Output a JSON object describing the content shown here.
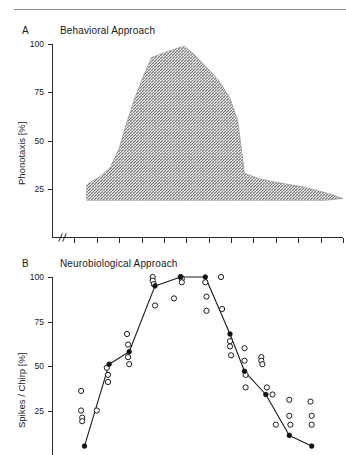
{
  "figure": {
    "background": "#ffffff",
    "ink": "#1a1a1a",
    "rule_color": "#8d8d8d"
  },
  "panels": {
    "a": {
      "letter": "A",
      "title": "Behavioral  Approach",
      "ylabel": "Phonotaxis  [%]",
      "yticks": [
        "100",
        "75",
        "50",
        "25"
      ]
    },
    "b": {
      "letter": "B",
      "title": "Neurobiological  Approach",
      "ylabel": "Spikes / Chirp  [%]",
      "yticks": [
        "100",
        "75",
        "50",
        "25"
      ]
    }
  },
  "chart_data": [
    {
      "type": "area",
      "panel": "A",
      "title": "Behavioral  Approach",
      "xlabel": "",
      "ylabel": "Phonotaxis [%]",
      "ylim": [
        0,
        100
      ],
      "yticks": [
        25,
        50,
        75,
        100
      ],
      "xlim": [
        0,
        13
      ],
      "xticks": [
        0,
        1,
        2,
        3,
        4,
        5,
        6,
        7,
        8,
        9,
        10,
        11,
        12,
        13
      ],
      "axis_break": true,
      "grid": false,
      "legend": "none",
      "fill_style": "hatched-gray",
      "x": [
        1.55,
        1.8,
        2.1,
        2.6,
        3.0,
        3.3,
        3.7,
        4.1,
        4.45,
        4.9,
        5.4,
        5.9,
        6.4,
        6.9,
        7.45,
        7.95,
        8.3,
        8.6,
        9.3,
        10.2,
        11.2,
        12.2,
        13.0
      ],
      "upper": [
        27,
        29,
        31,
        36,
        46,
        58,
        72,
        84,
        93,
        95,
        97,
        99,
        94,
        88,
        81,
        72,
        60,
        33,
        30,
        28,
        26,
        23,
        20
      ],
      "lower": [
        19,
        19,
        19,
        19,
        19,
        19,
        19,
        19,
        19,
        19,
        19,
        19,
        19,
        19,
        19,
        19,
        19,
        19,
        19,
        19,
        19,
        19,
        20
      ]
    },
    {
      "type": "scatter",
      "panel": "B",
      "title": "Neurobiological  Approach",
      "xlabel": "",
      "ylabel": "Spikes / Chirp [%]",
      "ylim": [
        0,
        100
      ],
      "yticks": [
        25,
        50,
        75,
        100
      ],
      "xlim": [
        0,
        13
      ],
      "xticks": [
        0,
        1,
        2,
        3,
        4,
        5,
        6,
        7,
        8,
        9,
        10,
        11,
        12,
        13
      ],
      "axis_break": true,
      "grid": false,
      "legend": "none",
      "series": [
        {
          "name": "mean",
          "marker": "filled-circle",
          "connected": true,
          "x": [
            1.45,
            2.55,
            3.45,
            4.6,
            5.75,
            6.85,
            7.95,
            8.6,
            9.55,
            10.6,
            11.6
          ],
          "values": [
            5,
            51,
            58,
            95,
            100,
            100,
            68,
            47,
            34,
            11,
            5
          ]
        },
        {
          "name": "individual",
          "marker": "open-circle",
          "connected": false,
          "points": [
            [
              1.3,
              36
            ],
            [
              1.3,
              25
            ],
            [
              1.35,
              21
            ],
            [
              1.35,
              19
            ],
            [
              2.0,
              25
            ],
            [
              2.45,
              49
            ],
            [
              2.5,
              45
            ],
            [
              2.5,
              41
            ],
            [
              3.35,
              68
            ],
            [
              3.4,
              62
            ],
            [
              3.4,
              55
            ],
            [
              3.45,
              51
            ],
            [
              4.5,
              100
            ],
            [
              4.5,
              98
            ],
            [
              4.55,
              96
            ],
            [
              4.6,
              84
            ],
            [
              5.45,
              88
            ],
            [
              5.75,
              100
            ],
            [
              5.8,
              99
            ],
            [
              5.8,
              97
            ],
            [
              6.85,
              97
            ],
            [
              6.9,
              89
            ],
            [
              6.9,
              81
            ],
            [
              7.55,
              100
            ],
            [
              7.6,
              82
            ],
            [
              7.95,
              64
            ],
            [
              7.95,
              61
            ],
            [
              8.0,
              56
            ],
            [
              8.6,
              60
            ],
            [
              8.6,
              53
            ],
            [
              8.65,
              45
            ],
            [
              8.65,
              38
            ],
            [
              9.35,
              55
            ],
            [
              9.35,
              53
            ],
            [
              9.4,
              51
            ],
            [
              9.6,
              38
            ],
            [
              9.85,
              34
            ],
            [
              10.6,
              31
            ],
            [
              10.6,
              22
            ],
            [
              10.65,
              17
            ],
            [
              11.55,
              30
            ],
            [
              11.6,
              22
            ],
            [
              11.6,
              17
            ],
            [
              10.0,
              17
            ]
          ]
        }
      ]
    }
  ]
}
